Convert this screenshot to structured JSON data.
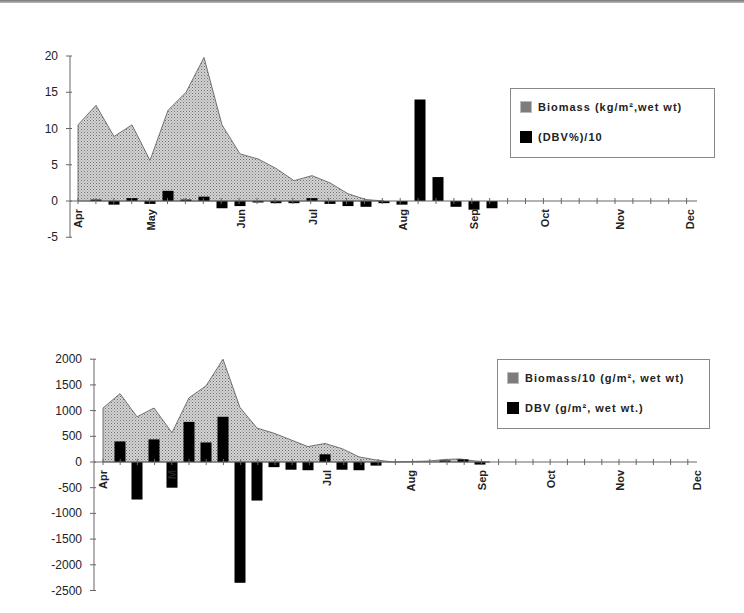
{
  "colors": {
    "area_fill": "#c8c8c8",
    "area_stroke": "#555555",
    "bar": "#000000",
    "axis": "#666666"
  },
  "chart_data": [
    {
      "type": "area+bar",
      "title": "",
      "xlabel": "",
      "ylabel": "",
      "ylim": [
        -5,
        20
      ],
      "yticks": [
        20,
        15,
        10,
        5,
        0,
        -5
      ],
      "month_labels": [
        "Apr",
        "May",
        "Jun",
        "Jul",
        "Aug",
        "Sep",
        "Oct",
        "Nov",
        "Dec"
      ],
      "legend": {
        "position": "upper right",
        "entries": [
          "Biomass (kg/m², wet wt)",
          "(DBV%)/10"
        ]
      },
      "series": [
        {
          "name": "Biomass (kg/m², wet wt)",
          "kind": "area",
          "x": [
            78,
            96,
            114,
            132,
            150,
            168,
            186,
            204,
            222,
            240,
            258,
            276,
            294,
            312,
            330,
            348,
            366,
            384
          ],
          "values": [
            10.5,
            13.2,
            8.9,
            10.5,
            5.6,
            12.5,
            15,
            19.8,
            10.5,
            6.5,
            5.8,
            4.5,
            2.8,
            3.5,
            2.5,
            1,
            0.2,
            0
          ]
        },
        {
          "name": "(DBV%)/10",
          "kind": "bar",
          "x": [
            96,
            114,
            132,
            150,
            168,
            186,
            204,
            222,
            240,
            258,
            276,
            294,
            312,
            330,
            348,
            366,
            384,
            402,
            420,
            438,
            456,
            474,
            492
          ],
          "values": [
            0.2,
            -0.5,
            0.4,
            -0.4,
            1.4,
            0.2,
            0.6,
            -1,
            -0.7,
            -0.2,
            -0.3,
            -0.3,
            0.4,
            -0.4,
            -0.7,
            -0.8,
            -0.3,
            -0.5,
            14,
            3.3,
            -0.8,
            -1.2,
            -1
          ]
        }
      ]
    },
    {
      "type": "area+bar",
      "title": "",
      "xlabel": "",
      "ylabel": "",
      "ylim": [
        -2500,
        2000
      ],
      "yticks": [
        2000,
        1500,
        1000,
        500,
        0,
        -500,
        -1000,
        -1500,
        -2000,
        -2500
      ],
      "month_labels": [
        "Apr",
        "M",
        "Jul",
        "Aug",
        "Sep",
        "Oct",
        "Nov",
        "Dec"
      ],
      "legend": {
        "position": "upper right",
        "entries": [
          "Biomass/10 (g/m², wet wt)",
          "DBV (g/m², wet wt.)"
        ]
      },
      "series": [
        {
          "name": "Biomass/10 (g/m², wet wt)",
          "kind": "area",
          "x": [
            103,
            120,
            137,
            154,
            172,
            189,
            206,
            223,
            240,
            257,
            274,
            291,
            308,
            325,
            342,
            359,
            376,
            393,
            430,
            445,
            460,
            475,
            490
          ],
          "values": [
            1050,
            1330,
            880,
            1050,
            570,
            1250,
            1480,
            2000,
            1060,
            660,
            560,
            430,
            300,
            360,
            260,
            100,
            40,
            0,
            20,
            50,
            60,
            20,
            0
          ]
        },
        {
          "name": "DBV (g/m², wet wt.)",
          "kind": "bar",
          "x": [
            120,
            137,
            154,
            172,
            189,
            206,
            223,
            240,
            257,
            274,
            291,
            308,
            325,
            342,
            359,
            376,
            445,
            463,
            480
          ],
          "values": [
            400,
            -730,
            440,
            -500,
            780,
            380,
            880,
            -2350,
            -750,
            -100,
            -150,
            -160,
            150,
            -150,
            -160,
            -70,
            30,
            50,
            -50
          ]
        }
      ]
    }
  ],
  "top_chart": {
    "yticks": [
      "20",
      "15",
      "10",
      "5",
      "0",
      "-5"
    ],
    "months": [
      "Apr",
      "May",
      "Jun",
      "Jul",
      "Aug",
      "Sep",
      "Oct",
      "Nov",
      "Dec"
    ],
    "legend": {
      "biomass": "Biomass (kg/m²,wet wt)",
      "dbv": "(DBV%)/10"
    }
  },
  "bottom_chart": {
    "yticks": [
      "2000",
      "1500",
      "1000",
      "500",
      "0",
      "-500",
      "-1000",
      "-1500",
      "-2000",
      "-2500"
    ],
    "months": [
      "Apr",
      "M",
      "Jul",
      "Aug",
      "Sep",
      "Oct",
      "Nov",
      "Dec"
    ],
    "legend": {
      "biomass": "Biomass/10 (g/m², wet wt)",
      "dbv": "DBV (g/m², wet wt.)"
    }
  }
}
